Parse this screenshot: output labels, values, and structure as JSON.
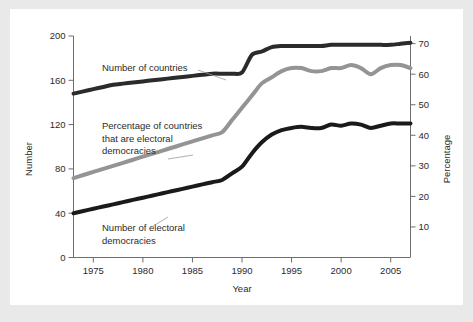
{
  "figure": {
    "background_color": "#e9e9e9",
    "card_color": "#ffffff"
  },
  "chart_data": {
    "type": "line",
    "title": "",
    "xlabel": "Year",
    "ylabel": "Number",
    "y2label": "Percentage",
    "xlim": [
      1973,
      2007
    ],
    "ylim": [
      0,
      200
    ],
    "y2lim": [
      0,
      72.5
    ],
    "grid": false,
    "legend": "none (inline annotations with leader lines)",
    "xticks": [
      1975,
      1980,
      1985,
      1990,
      1995,
      2000,
      2005
    ],
    "xtick_labels": [
      "1975",
      "1980",
      "1985",
      "1990",
      "1995",
      "2000",
      "2005"
    ],
    "yticks": [
      0,
      40,
      80,
      120,
      160,
      200
    ],
    "ytick_labels": [
      "0",
      "40",
      "80",
      "120",
      "160",
      "200"
    ],
    "y2ticks": [
      10,
      20,
      30,
      40,
      50,
      60,
      70
    ],
    "y2tick_labels": [
      "10",
      "20",
      "30",
      "40",
      "50",
      "60",
      "70"
    ],
    "x": [
      1973,
      1974,
      1975,
      1976,
      1977,
      1978,
      1979,
      1980,
      1981,
      1982,
      1983,
      1984,
      1985,
      1986,
      1987,
      1988,
      1989,
      1990,
      1991,
      1992,
      1993,
      1994,
      1995,
      1996,
      1997,
      1998,
      1999,
      2000,
      2001,
      2002,
      2003,
      2004,
      2005,
      2006,
      2007
    ],
    "series": [
      {
        "name": "Number of countries",
        "axis": "left",
        "color": "#2b2b2b",
        "line_width": 4,
        "values": [
          148,
          150,
          152,
          154,
          156,
          157,
          158,
          159,
          160,
          161,
          162,
          163,
          164,
          165,
          166,
          166,
          166,
          167,
          183,
          186,
          190,
          191,
          191,
          191,
          191,
          191,
          192,
          192,
          192,
          192,
          192,
          192,
          192,
          193,
          194
        ]
      },
      {
        "name": "Percentage of countries that are electoral democracies",
        "axis": "right",
        "color": "#949494",
        "line_width": 4,
        "values": [
          26,
          27,
          28,
          29,
          30,
          31,
          32,
          33,
          34,
          35,
          36,
          37,
          38,
          39,
          40,
          41,
          45,
          49,
          53,
          57,
          59,
          61,
          62,
          62,
          61,
          61,
          62,
          62,
          63,
          62,
          60,
          62,
          63,
          63,
          62
        ]
      },
      {
        "name": "Number of electoral democracies",
        "axis": "left",
        "color": "#1a1a1a",
        "line_width": 4,
        "values": [
          40,
          42,
          44,
          46,
          48,
          50,
          52,
          54,
          56,
          58,
          60,
          62,
          64,
          66,
          68,
          70,
          76,
          82,
          94,
          104,
          111,
          115,
          117,
          118,
          117,
          117,
          120,
          119,
          121,
          120,
          117,
          119,
          121,
          121,
          121
        ]
      }
    ],
    "annotations": [
      {
        "id": "annot-number-of-countries",
        "lines": [
          "Number of countries"
        ],
        "x": 92,
        "y": 62,
        "leader": [
          [
            188,
            61
          ],
          [
            216,
            71
          ]
        ]
      },
      {
        "id": "annot-percentage-electoral-democracies",
        "lines": [
          "Percentage of countries",
          "that are electoral",
          "democracies"
        ],
        "x": 92,
        "y": 120,
        "leader": [
          [
            158,
            150
          ],
          [
            183,
            146
          ]
        ]
      },
      {
        "id": "annot-number-electoral-democracies",
        "lines": [
          "Number of electoral",
          "democracies"
        ],
        "x": 92,
        "y": 222,
        "leader": [
          [
            140,
            219
          ],
          [
            158,
            208
          ]
        ]
      }
    ]
  }
}
